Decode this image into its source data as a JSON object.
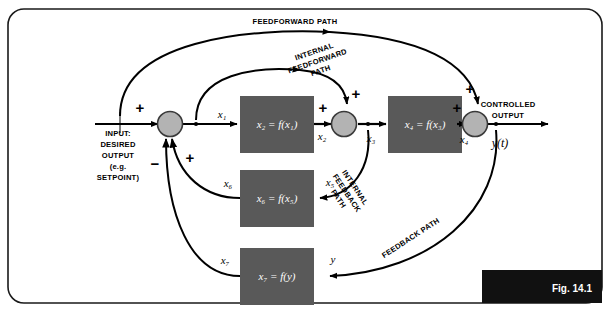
{
  "figure": {
    "number": "Fig. 14.1",
    "frame_color": "#1a1a1a",
    "background": "#ffffff",
    "block_fill": "#595959",
    "junction_fill": "#b3b3b3",
    "line_color": "#000000"
  },
  "io": {
    "input_label": "INPUT:\nDESIRED\nOUTPUT\n(e.g.\nSETPOINT)",
    "input_lines": [
      "INPUT:",
      "DESIRED",
      "OUTPUT",
      "(e.g.",
      "SETPOINT)"
    ],
    "output_lines": [
      "CONTROLLED",
      "OUTPUT"
    ],
    "output_signal": "y(t)"
  },
  "blocks": [
    {
      "id": "block-x2",
      "label": "x2 = f(x1)",
      "display": "x₂ = f(x₁)"
    },
    {
      "id": "block-x4",
      "label": "x4 = f(x3)",
      "display": "x₄ = f(x₃)"
    },
    {
      "id": "block-x6",
      "label": "x6 = f(x5)",
      "display": "x₆ = f(x₅)"
    },
    {
      "id": "block-x7",
      "label": "x7 = f(y)",
      "display": "x₇ = f(y)"
    }
  ],
  "junctions": [
    {
      "id": "summing-junction-1",
      "signs": [
        "+",
        "+",
        "-"
      ]
    },
    {
      "id": "summing-junction-2",
      "signs": [
        "+",
        "+"
      ]
    },
    {
      "id": "summing-junction-3",
      "signs": [
        "+",
        "+"
      ]
    }
  ],
  "signals": {
    "x1": "x₁",
    "x2": "x₂",
    "x3": "x₃",
    "x4": "x₄",
    "x5": "x₅",
    "x6": "x₆",
    "x7": "x₇",
    "y": "y"
  },
  "signs": {
    "input_plus": "+",
    "internal_fb_plus": "+",
    "main_fb_minus": "−",
    "j2_left_plus": "+",
    "j2_top_plus": "+",
    "j3_left_plus": "+",
    "j3_top_plus": "+"
  },
  "paths": [
    {
      "id": "feedforward-path",
      "lines": [
        "FEEDFORWARD PATH"
      ]
    },
    {
      "id": "internal-feedforward-path",
      "lines": [
        "INTERNAL",
        "FEEDFORWARD",
        "PATH"
      ]
    },
    {
      "id": "internal-feedback-path",
      "lines": [
        "INTERNAL",
        "FEEDBACK",
        "PATH"
      ]
    },
    {
      "id": "feedback-path",
      "lines": [
        "FEEDBACK PATH"
      ]
    }
  ]
}
